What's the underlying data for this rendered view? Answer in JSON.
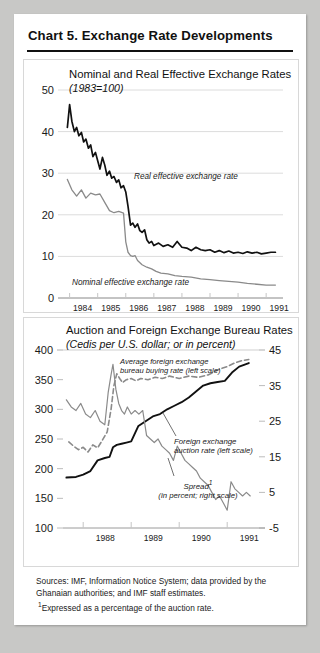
{
  "card": {
    "title": "Chart 5.  Exchange Rate Developments"
  },
  "sources": {
    "line1": "Sources: IMF, Information Notice System; data provided by the Ghanaian authorities; and IMF staff estimates.",
    "footnote_marker": "1",
    "footnote": "Expressed as a percentage of the auction rate."
  },
  "chart_data": [
    {
      "type": "line",
      "title": "Nominal and Real Effective Exchange Rates",
      "subtitle": "(1983=100)",
      "xlabel": "",
      "ylabel": "",
      "ylim": [
        0,
        50
      ],
      "yticks": [
        0,
        10,
        20,
        30,
        40,
        50
      ],
      "xlim": [
        1983.8,
        1991.6
      ],
      "xticks": [
        1984,
        1985,
        1986,
        1987,
        1988,
        1989,
        1990,
        1991
      ],
      "xticklabels": [
        "1984",
        "1985",
        "1986",
        "1987",
        "1988",
        "1989",
        "1990",
        "1991"
      ],
      "grid": true,
      "legend_position": "inline-annotation",
      "series": [
        {
          "name": "Real effective exchange rate",
          "color": "#111111",
          "style": "solid",
          "annotation": "Real effective exchange rate",
          "x": [
            1983.92,
            1984.0,
            1984.08,
            1984.17,
            1984.25,
            1984.33,
            1984.42,
            1984.5,
            1984.58,
            1984.67,
            1984.75,
            1984.83,
            1984.92,
            1985.0,
            1985.08,
            1985.17,
            1985.25,
            1985.33,
            1985.42,
            1985.5,
            1985.58,
            1985.67,
            1985.75,
            1985.83,
            1985.92,
            1986.0,
            1986.08,
            1986.17,
            1986.25,
            1986.33,
            1986.42,
            1986.5,
            1986.58,
            1986.67,
            1986.75,
            1986.83,
            1986.92,
            1987.0,
            1987.17,
            1987.33,
            1987.5,
            1987.67,
            1987.83,
            1988.0,
            1988.17,
            1988.33,
            1988.5,
            1988.67,
            1988.83,
            1989.0,
            1989.17,
            1989.33,
            1989.5,
            1989.67,
            1989.83,
            1990.0,
            1990.17,
            1990.33,
            1990.5,
            1990.67,
            1990.83,
            1991.0,
            1991.17,
            1991.33
          ],
          "values": [
            41.0,
            46.5,
            42.5,
            40.0,
            41.0,
            39.0,
            39.8,
            37.5,
            38.2,
            36.0,
            36.8,
            34.0,
            35.0,
            33.0,
            31.0,
            33.8,
            32.0,
            29.5,
            30.5,
            28.8,
            29.2,
            27.8,
            28.4,
            26.5,
            27.0,
            25.5,
            22.0,
            17.5,
            18.0,
            17.0,
            17.8,
            16.2,
            15.8,
            16.4,
            14.0,
            13.2,
            13.6,
            12.6,
            13.2,
            12.4,
            12.8,
            12.2,
            13.6,
            12.2,
            12.0,
            11.4,
            12.2,
            11.6,
            11.4,
            11.6,
            11.0,
            11.4,
            10.9,
            11.3,
            10.8,
            11.0,
            10.7,
            11.1,
            10.8,
            11.0,
            10.6,
            10.8,
            11.0,
            11.0
          ]
        },
        {
          "name": "Nominal effective exchange rate",
          "color": "#8a8a8a",
          "style": "solid",
          "annotation": "Nominal effective exchange rate",
          "x": [
            1983.92,
            1984.08,
            1984.25,
            1984.42,
            1984.58,
            1984.75,
            1984.92,
            1985.08,
            1985.25,
            1985.42,
            1985.58,
            1985.75,
            1985.92,
            1986.0,
            1986.08,
            1986.17,
            1986.25,
            1986.33,
            1986.42,
            1986.58,
            1986.75,
            1986.92,
            1987.08,
            1987.25,
            1987.5,
            1987.75,
            1988.0,
            1988.33,
            1988.67,
            1989.0,
            1989.33,
            1989.67,
            1990.0,
            1990.33,
            1990.67,
            1991.0,
            1991.33
          ],
          "values": [
            28.5,
            26.0,
            24.5,
            26.0,
            24.0,
            25.2,
            24.8,
            25.0,
            23.0,
            21.0,
            20.5,
            20.8,
            20.4,
            13.5,
            11.0,
            10.2,
            10.0,
            10.2,
            9.0,
            8.0,
            7.4,
            7.0,
            6.4,
            6.0,
            5.8,
            5.4,
            5.2,
            5.0,
            4.6,
            4.4,
            4.2,
            4.0,
            3.8,
            3.5,
            3.3,
            3.1,
            3.1
          ]
        }
      ]
    },
    {
      "type": "line",
      "title": "Auction and Foreign Exchange Bureau Rates",
      "subtitle": "(Cedis per U.S. dollar; or in percent)",
      "xlabel": "",
      "ylabel_left": "",
      "ylabel_right": "",
      "ylim_left": [
        100,
        400
      ],
      "yticks_left": [
        100,
        150,
        200,
        250,
        300,
        350,
        400
      ],
      "ylim_right": [
        -5,
        45
      ],
      "yticks_right": [
        -5,
        5,
        15,
        25,
        35,
        45
      ],
      "xlim": [
        1987.6,
        1991.6
      ],
      "xticks": [
        1988,
        1989,
        1990,
        1991
      ],
      "xticklabels": [
        "1988",
        "1989",
        "1990",
        "1991"
      ],
      "grid": true,
      "legend_position": "inline-annotation",
      "series": [
        {
          "name": "Average foreign exchange bureau buying rate (left scale)",
          "color": "#8a8a8a",
          "style": "dashed",
          "scale": "left",
          "annotation": "Average foreign exchange bureau buying rate (left scale)",
          "x": [
            1987.7,
            1987.8,
            1987.9,
            1988.0,
            1988.1,
            1988.2,
            1988.3,
            1988.4,
            1988.5,
            1988.58,
            1988.64,
            1988.7,
            1988.76,
            1988.82,
            1988.9,
            1989.0,
            1989.1,
            1989.2,
            1989.35,
            1989.5,
            1989.65,
            1989.8,
            1990.0,
            1990.2,
            1990.4,
            1990.6,
            1990.75,
            1990.85,
            1991.0,
            1991.15,
            1991.3,
            1991.45
          ],
          "values": [
            245,
            238,
            232,
            236,
            228,
            240,
            235,
            248,
            262,
            300,
            340,
            360,
            352,
            345,
            350,
            352,
            348,
            352,
            350,
            354,
            352,
            356,
            352,
            356,
            354,
            358,
            364,
            368,
            372,
            378,
            382,
            384
          ]
        },
        {
          "name": "Foreign exchange auction rate (left scale)",
          "color": "#111111",
          "style": "solid",
          "scale": "left",
          "annotation": "Foreign exchange auction rate (left scale)",
          "x": [
            1987.65,
            1987.85,
            1988.0,
            1988.15,
            1988.3,
            1988.45,
            1988.55,
            1988.62,
            1988.7,
            1988.8,
            1988.9,
            1989.0,
            1989.15,
            1989.3,
            1989.45,
            1989.6,
            1989.75,
            1989.9,
            1990.05,
            1990.2,
            1990.35,
            1990.5,
            1990.65,
            1990.8,
            1990.95,
            1991.1,
            1991.25,
            1991.45
          ],
          "values": [
            185,
            186,
            190,
            196,
            214,
            218,
            220,
            236,
            240,
            242,
            244,
            246,
            272,
            280,
            288,
            292,
            300,
            306,
            312,
            320,
            330,
            340,
            344,
            346,
            348,
            362,
            372,
            378
          ]
        },
        {
          "name": "Spread (in percent; right scale)",
          "color": "#8a8a8a",
          "style": "solid",
          "scale": "right",
          "annotation_line1": "Spread",
          "annotation_line2": "(in percent; right scale)",
          "footnote_marker": "1",
          "x": [
            1987.65,
            1987.75,
            1987.85,
            1987.95,
            1988.05,
            1988.15,
            1988.25,
            1988.35,
            1988.45,
            1988.52,
            1988.58,
            1988.62,
            1988.68,
            1988.74,
            1988.8,
            1988.86,
            1988.92,
            1989.0,
            1989.08,
            1989.16,
            1989.24,
            1989.32,
            1989.4,
            1989.48,
            1989.56,
            1989.64,
            1989.72,
            1989.8,
            1989.88,
            1989.96,
            1990.04,
            1990.12,
            1990.2,
            1990.28,
            1990.36,
            1990.44,
            1990.52,
            1990.6,
            1990.68,
            1990.76,
            1990.84,
            1990.92,
            1991.0,
            1991.08,
            1991.16,
            1991.24,
            1991.32,
            1991.4,
            1991.48
          ],
          "values": [
            31,
            29,
            28,
            30,
            27,
            26,
            28,
            25,
            24,
            33,
            38,
            41,
            34,
            30,
            28,
            27,
            29,
            27,
            28,
            27,
            28,
            21,
            20,
            19,
            20,
            18,
            17,
            16,
            14,
            18,
            16,
            14,
            13,
            12,
            11,
            9,
            8,
            7,
            5,
            3,
            4,
            2,
            0,
            8,
            6,
            5,
            4,
            5,
            4
          ]
        }
      ]
    }
  ]
}
